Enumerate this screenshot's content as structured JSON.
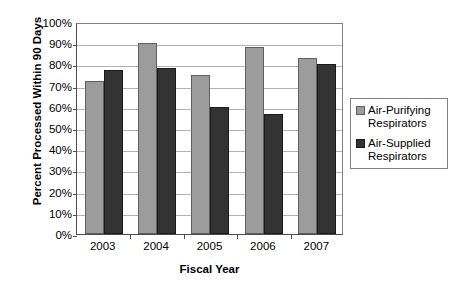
{
  "chart_data": {
    "type": "bar",
    "title": "",
    "xlabel": "Fiscal Year",
    "ylabel": "Percent Processed Within 90 Days",
    "categories": [
      "2003",
      "2004",
      "2005",
      "2006",
      "2007"
    ],
    "series": [
      {
        "name": "Air-Purifying Respirators",
        "color": "#9c9c9c",
        "values": [
          72,
          90,
          75,
          88,
          83
        ]
      },
      {
        "name": "Air-Supplied Respirators",
        "color": "#333333",
        "values": [
          77.5,
          78.5,
          60,
          56.5,
          80
        ]
      }
    ],
    "ylim": [
      0,
      100
    ],
    "ytick_step": 10,
    "ytick_labels": [
      "0%",
      "10%",
      "20%",
      "30%",
      "40%",
      "50%",
      "60%",
      "70%",
      "80%",
      "90%",
      "100%"
    ],
    "grid": true,
    "legend_position": "right"
  },
  "legend": {
    "entries": [
      {
        "label_line1": "Air-Purifying",
        "label_line2": "Respirators",
        "swatch": "light-gray-swatch"
      },
      {
        "label_line1": "Air-Supplied",
        "label_line2": "Respirators",
        "swatch": "dark-gray-swatch"
      }
    ]
  },
  "colors": {
    "series_light": "#9c9c9c",
    "series_dark": "#333333",
    "gridline": "#b3b3b3",
    "axis": "#4d4d4d",
    "background": "#ffffff"
  }
}
